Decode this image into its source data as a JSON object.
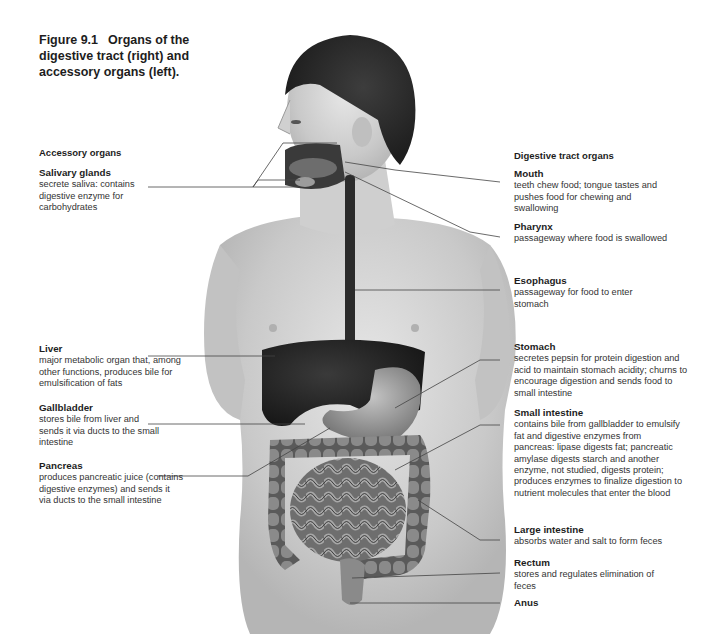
{
  "figure": {
    "number": "Figure 9.1",
    "caption": "Organs of the digestive tract (right) and accessory organs (left)."
  },
  "left_section": {
    "heading": "Accessory organs",
    "labels": [
      {
        "name": "Salivary glands",
        "description": "secrete saliva: contains digestive enzyme for carbohydrates"
      },
      {
        "name": "Liver",
        "description": "major metabolic organ that, among other functions, produces bile for emulsification of fats"
      },
      {
        "name": "Gallbladder",
        "description": "stores bile from liver and sends it via ducts to the small intestine"
      },
      {
        "name": "Pancreas",
        "description": "produces pancreatic juice (contains digestive enzymes) and sends it via ducts to the small intestine"
      }
    ]
  },
  "right_section": {
    "heading": "Digestive tract organs",
    "labels": [
      {
        "name": "Mouth",
        "description": "teeth chew food; tongue tastes and pushes food for chewing and swallowing"
      },
      {
        "name": "Pharynx",
        "description": "passageway where food is swallowed"
      },
      {
        "name": "Esophagus",
        "description": "passageway for food to enter stomach"
      },
      {
        "name": "Stomach",
        "description": "secretes pepsin for protein digestion and acid to maintain stomach acidity; churns to encourage digestion and sends food to small intestine"
      },
      {
        "name": "Small intestine",
        "description": "contains bile from gallbladder to emulsify fat and digestive enzymes from pancreas: lipase digests fat; pancreatic amylase digests starch and another enzyme, not studied, digests protein; produces enzymes to finalize digestion to nutrient molecules that enter the blood"
      },
      {
        "name": "Large intestine",
        "description": "absorbs water and salt to form feces"
      },
      {
        "name": "Rectum",
        "description": "stores and regulates elimination of feces"
      },
      {
        "name": "Anus",
        "description": ""
      }
    ]
  },
  "colors": {
    "skin": "#d9d9d9",
    "hair": "#2e2e2e",
    "liver": "#2a2a2a",
    "stomach": "#9a9a9a",
    "intestine": "#7d7d7d",
    "leader_line": "#444444"
  }
}
